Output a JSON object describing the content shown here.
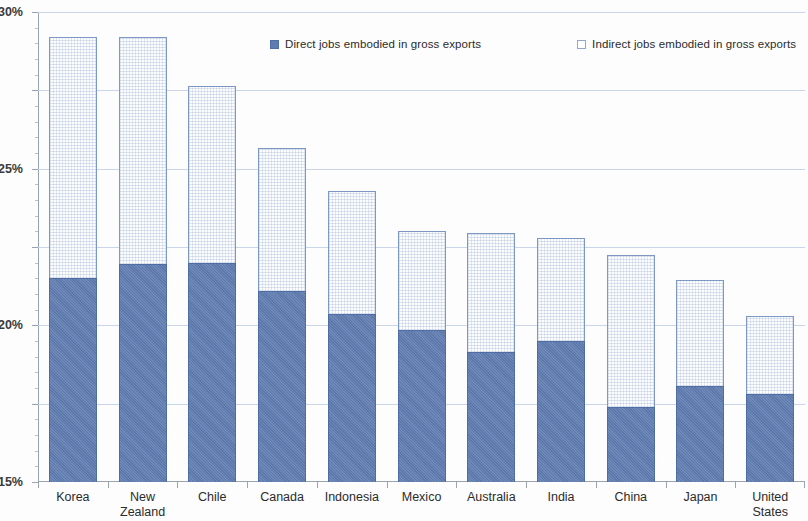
{
  "chart_data": {
    "type": "bar",
    "subtype": "stacked-bar",
    "title": "",
    "xlabel": "",
    "ylabel": "",
    "ylim": [
      0,
      30
    ],
    "ytick_labels": [
      "0%",
      "5%",
      "10%",
      "15%",
      "20%",
      "25%",
      "30%"
    ],
    "ytick_values": [
      0,
      5,
      10,
      15,
      20,
      25,
      30
    ],
    "y_unit": "%",
    "grid": true,
    "legend_position": "top",
    "categories": [
      "Korea",
      "New Zealand",
      "Chile",
      "Canada",
      "Indonesia",
      "Mexico",
      "Australia",
      "India",
      "China",
      "Japan",
      "United States"
    ],
    "series": [
      {
        "name": "Direct jobs embodied in gross exports",
        "color": "#5f7cb0",
        "values": [
          13.0,
          13.9,
          14.0,
          12.2,
          10.7,
          9.7,
          8.3,
          9.0,
          4.8,
          6.1,
          5.6
        ]
      },
      {
        "name": "Indirect jobs embodied in gross exports",
        "color": "#fbfcfe",
        "values": [
          15.4,
          14.5,
          11.3,
          9.1,
          7.9,
          6.3,
          7.6,
          6.6,
          9.7,
          6.8,
          5.0
        ]
      }
    ],
    "totals": [
      28.4,
      28.4,
      25.3,
      21.3,
      18.6,
      16.0,
      15.9,
      15.6,
      14.5,
      12.9,
      10.6
    ]
  },
  "legend": {
    "entries": [
      {
        "label": "Direct jobs embodied in gross exports",
        "marker": "filled-square"
      },
      {
        "label": "Indirect jobs embodied in gross exports",
        "marker": "hollow-square"
      }
    ]
  },
  "axis": {
    "y_labels": [
      "30%",
      "25%",
      "20%",
      "15%",
      "10%",
      "5%",
      "0%"
    ],
    "x_labels": [
      [
        "Korea"
      ],
      [
        "New",
        "Zealand"
      ],
      [
        "Chile"
      ],
      [
        "Canada"
      ],
      [
        "Indonesia"
      ],
      [
        "Mexico"
      ],
      [
        "Australia"
      ],
      [
        "India"
      ],
      [
        "China"
      ],
      [
        "Japan"
      ],
      [
        "United",
        "States"
      ]
    ]
  },
  "colors": {
    "direct_fill": "#5f7cb0",
    "direct_border": "#4e6da5",
    "indirect_fill": "#fbfcfe",
    "indirect_border": "#7e98c4",
    "gridline": "#c9d5e8",
    "axis": "#9aa3ae",
    "text": "#2b2b2b"
  }
}
